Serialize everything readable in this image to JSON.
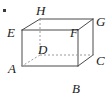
{
  "figure": {
    "type": "cuboid-net-diagram",
    "solid_edge_color": "#4a4a4a",
    "hidden_edge_color": "#9a9a9a",
    "label_color": "#1a1a1a",
    "background_color": "#ffffff",
    "canvas": {
      "width": 108,
      "height": 102
    }
  },
  "vertices": [
    {
      "id": "A",
      "label": "A",
      "role": "front-bottom-left",
      "x": 22,
      "y": 66,
      "label_x": 8,
      "label_y": 62,
      "hidden": false
    },
    {
      "id": "B",
      "label": "B",
      "role": "back-bottom-right-projected",
      "x": 78,
      "y": 66,
      "label_x": 72,
      "label_y": 82,
      "hidden": false
    },
    {
      "id": "C",
      "label": "C",
      "role": "front-bottom-right",
      "x": 93,
      "y": 55,
      "label_x": 96,
      "label_y": 54,
      "hidden": false
    },
    {
      "id": "D",
      "label": "D",
      "role": "back-bottom-left",
      "x": 40,
      "y": 55,
      "label_x": 38,
      "label_y": 43,
      "hidden": true
    },
    {
      "id": "E",
      "label": "E",
      "role": "front-top-left",
      "x": 22,
      "y": 30,
      "label_x": 7,
      "label_y": 26,
      "hidden": false
    },
    {
      "id": "F",
      "label": "F",
      "role": "back-top-left-projected",
      "x": 78,
      "y": 30,
      "label_x": 70,
      "label_y": 26,
      "hidden": false
    },
    {
      "id": "G",
      "label": "G",
      "role": "front-top-right",
      "x": 93,
      "y": 19,
      "label_x": 96,
      "label_y": 15,
      "hidden": false
    },
    {
      "id": "H",
      "label": "H",
      "role": "back-top-left",
      "x": 40,
      "y": 19,
      "label_x": 36,
      "label_y": 4,
      "hidden": false
    }
  ],
  "edges": [
    {
      "from": "E",
      "to": "F",
      "style": "solid"
    },
    {
      "from": "F",
      "to": "B",
      "style": "solid"
    },
    {
      "from": "B",
      "to": "A",
      "style": "solid"
    },
    {
      "from": "A",
      "to": "E",
      "style": "solid"
    },
    {
      "from": "H",
      "to": "G",
      "style": "solid"
    },
    {
      "from": "G",
      "to": "C",
      "style": "solid"
    },
    {
      "from": "E",
      "to": "H",
      "style": "solid"
    },
    {
      "from": "F",
      "to": "G",
      "style": "solid"
    },
    {
      "from": "B",
      "to": "C",
      "style": "solid"
    },
    {
      "from": "H",
      "to": "D",
      "style": "dashed"
    },
    {
      "from": "D",
      "to": "A",
      "style": "dashed"
    },
    {
      "from": "D",
      "to": "C",
      "style": "dashed"
    }
  ],
  "marks": [
    {
      "id": "corner-dot",
      "x": 3,
      "y": 9,
      "width": 3,
      "height": 3
    }
  ]
}
